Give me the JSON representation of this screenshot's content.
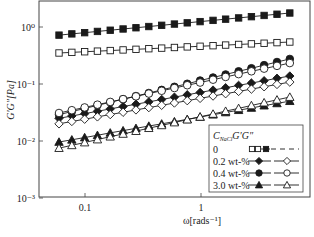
{
  "chart_data": {
    "type": "scatter",
    "title": "",
    "xlabel": "ω[rads⁻¹]",
    "ylabel": "G′G″[Pa]",
    "xscale": "log",
    "yscale": "log",
    "xlim": [
      0.039,
      9.2
    ],
    "ylim": [
      0.001,
      3.0
    ],
    "grid": false,
    "legend_position": "lower right (inside)",
    "x_ticks": [
      {
        "value": 0.1,
        "label": "0.1"
      },
      {
        "value": 1,
        "label": "1"
      }
    ],
    "y_ticks": [
      {
        "value": 1,
        "label": "10⁰"
      },
      {
        "value": 0.1,
        "label": "10⁻¹"
      },
      {
        "value": 0.01,
        "label": "10⁻²"
      },
      {
        "value": 0.001,
        "label": "10⁻³"
      }
    ],
    "legend": {
      "header": {
        "main": "C",
        "sub": "NaCl",
        "tail": "G′G″"
      },
      "rows": [
        {
          "label": "0",
          "gp": "filled-square",
          "gpp": "open-square"
        },
        {
          "label": "0.2 wt-%",
          "gp": "filled-diamond",
          "gpp": "open-diamond"
        },
        {
          "label": "0.4 wt-%",
          "gp": "filled-circle",
          "gpp": "open-circle"
        },
        {
          "label": "3.0 wt-%",
          "gp": "filled-triangle",
          "gpp": "open-triangle"
        }
      ]
    },
    "x": [
      0.0597,
      0.077,
      0.0993,
      0.128,
      0.165,
      0.213,
      0.275,
      0.355,
      0.458,
      0.59,
      0.761,
      0.982,
      1.27,
      1.63,
      2.11,
      2.72,
      3.5,
      4.52,
      5.83
    ],
    "series": [
      {
        "name": "0 G′",
        "marker": "square",
        "filled": true,
        "values": [
          0.72,
          0.757,
          0.795,
          0.836,
          0.878,
          0.923,
          0.97,
          1.019,
          1.071,
          1.126,
          1.183,
          1.243,
          1.307,
          1.373,
          1.443,
          1.517,
          1.594,
          1.675,
          1.76
        ]
      },
      {
        "name": "0 G″",
        "marker": "square",
        "filled": false,
        "values": [
          0.35,
          0.359,
          0.368,
          0.377,
          0.386,
          0.396,
          0.406,
          0.416,
          0.426,
          0.437,
          0.448,
          0.459,
          0.47,
          0.482,
          0.494,
          0.506,
          0.519,
          0.532,
          0.545
        ]
      },
      {
        "name": "0.2 wt-% G′",
        "marker": "diamond",
        "filled": true,
        "values": [
          0.025,
          0.0275,
          0.0302,
          0.0332,
          0.0366,
          0.0402,
          0.0442,
          0.0486,
          0.0535,
          0.0588,
          0.0647,
          0.0711,
          0.0782,
          0.086,
          0.0946,
          0.104,
          0.114,
          0.126,
          0.138
        ]
      },
      {
        "name": "0.2 wt-% G″",
        "marker": "diamond",
        "filled": false,
        "values": [
          0.02,
          0.022,
          0.0241,
          0.0265,
          0.0291,
          0.0319,
          0.0351,
          0.0385,
          0.0423,
          0.0464,
          0.051,
          0.056,
          0.0615,
          0.0675,
          0.0741,
          0.0814,
          0.0894,
          0.0982,
          0.108
        ]
      },
      {
        "name": "0.4 wt-% G′",
        "marker": "circle",
        "filled": true,
        "values": [
          0.029,
          0.0329,
          0.0372,
          0.0422,
          0.0478,
          0.0542,
          0.0614,
          0.0695,
          0.0788,
          0.0893,
          0.101,
          0.115,
          0.13,
          0.147,
          0.167,
          0.189,
          0.214,
          0.243,
          0.275
        ]
      },
      {
        "name": "0.4 wt-% G″",
        "marker": "circle",
        "filled": false,
        "values": [
          0.031,
          0.0347,
          0.0388,
          0.0434,
          0.0485,
          0.0543,
          0.0607,
          0.0679,
          0.076,
          0.085,
          0.0951,
          0.106,
          0.119,
          0.133,
          0.149,
          0.167,
          0.186,
          0.208,
          0.233
        ]
      },
      {
        "name": "3.0 wt-% G′",
        "marker": "triangle",
        "filled": true,
        "values": [
          0.0096,
          0.0105,
          0.0115,
          0.0126,
          0.0139,
          0.0152,
          0.0167,
          0.0183,
          0.02,
          0.0219,
          0.024,
          0.0264,
          0.0289,
          0.0317,
          0.0347,
          0.038,
          0.0417,
          0.0457,
          0.05
        ]
      },
      {
        "name": "3.0 wt-% G″",
        "marker": "triangle",
        "filled": false,
        "values": [
          0.0075,
          0.0084,
          0.0094,
          0.0106,
          0.0119,
          0.0133,
          0.0149,
          0.0168,
          0.0188,
          0.0211,
          0.0237,
          0.0265,
          0.0298,
          0.0334,
          0.0374,
          0.042,
          0.0471,
          0.0528,
          0.059
        ]
      }
    ]
  },
  "colors": {
    "ink": "#1a1a1a",
    "background": "#ffffff",
    "frame": "#444444"
  }
}
